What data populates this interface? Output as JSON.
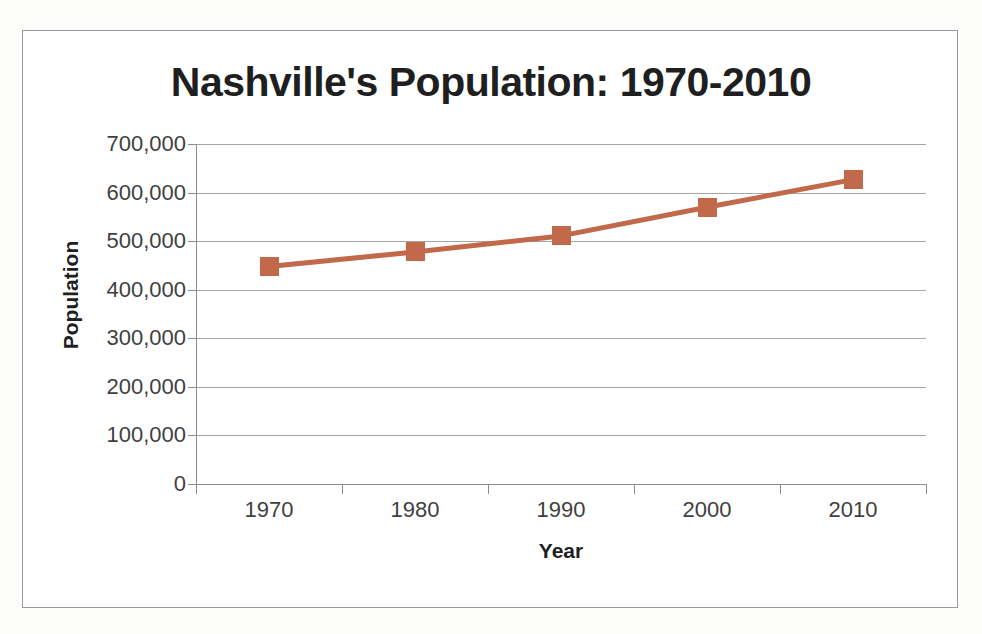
{
  "chart_data": {
    "type": "line",
    "title": "Nashville's Population: 1970-2010",
    "xlabel": "Year",
    "ylabel": "Population",
    "categories": [
      "1970",
      "1980",
      "1990",
      "2000",
      "2010"
    ],
    "values": [
      447877,
      477811,
      510784,
      569891,
      626681
    ],
    "series": [
      {
        "name": "Population",
        "values": [
          447877,
          477811,
          510784,
          569891,
          626681
        ]
      }
    ],
    "ylim": [
      0,
      700000
    ],
    "yticks": [
      0,
      100000,
      200000,
      300000,
      400000,
      500000,
      600000,
      700000
    ],
    "ytick_labels": [
      "0",
      "100,000",
      "200,000",
      "300,000",
      "400,000",
      "500,000",
      "600,000",
      "700,000"
    ],
    "grid": true,
    "legend": false,
    "legend_position": "none",
    "marker": "square",
    "colors": {
      "series": "#C1694A",
      "line": "#C1694A",
      "marker": "#C1694A",
      "gridline": "#A6A6A6",
      "axis": "#8C8C8C",
      "tick_label": "#3F3F3F",
      "title": "#1F1F1F",
      "frame_border": "#9A9A9A",
      "background": "#FFFFFF",
      "page_background": "#FDFDFC"
    }
  }
}
